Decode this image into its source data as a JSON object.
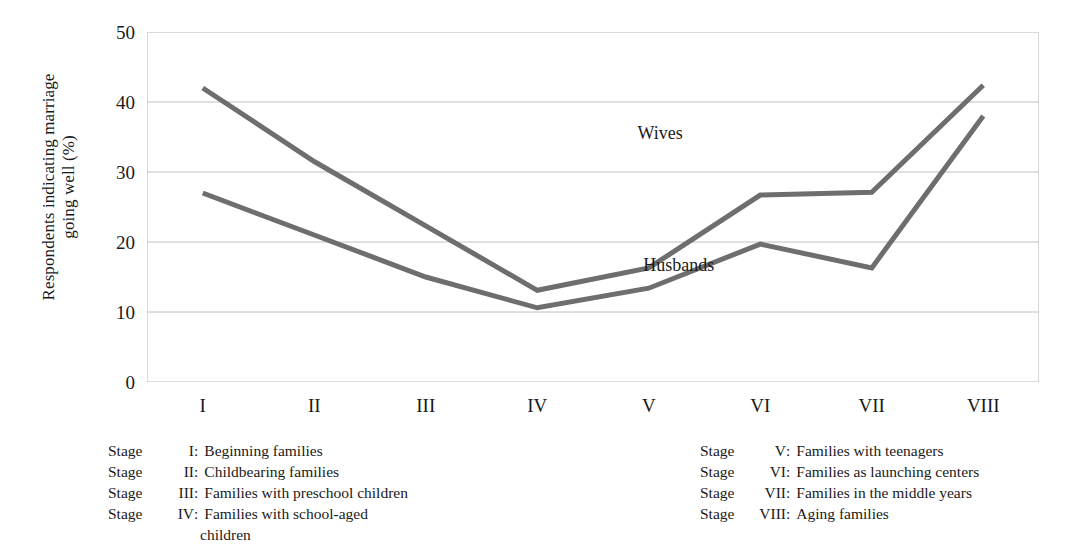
{
  "chart_data": {
    "type": "line",
    "title": "",
    "xlabel": "",
    "ylabel": "Respondents indicating marriage going well (%)",
    "ylabel_line1": "Respondents indicating marriage",
    "ylabel_line2": "going well (%)",
    "categories": [
      "I",
      "II",
      "III",
      "IV",
      "V",
      "VI",
      "VII",
      "VIII"
    ],
    "ylim": [
      0,
      50
    ],
    "yticks": [
      0,
      10,
      20,
      30,
      40,
      50
    ],
    "xlim": [
      0,
      8
    ],
    "grid": true,
    "legend_position": "inline-labels",
    "line_color": "#6e6e6e",
    "grid_color": "#b9b9b9",
    "series": [
      {
        "name": "Wives",
        "label_x": 4.4,
        "label_y": 35.5,
        "values": [
          42.0,
          31.5,
          22.3,
          13.1,
          16.3,
          26.7,
          27.1,
          42.4
        ]
      },
      {
        "name": "Husbands",
        "label_x": 4.45,
        "label_y": 16.6,
        "values": [
          27.0,
          21.0,
          15.0,
          10.6,
          13.4,
          19.7,
          16.3,
          38.0
        ]
      }
    ]
  },
  "axis": {
    "ytick_labels": [
      "50",
      "40",
      "30",
      "20",
      "10",
      "0"
    ],
    "xtick_labels": [
      "I",
      "II",
      "III",
      "IV",
      "V",
      "VI",
      "VII",
      "VIII"
    ]
  },
  "legend": {
    "left_column": [
      {
        "stage": "Stage",
        "numeral": "I",
        "colon": ":",
        "text": "Beginning families"
      },
      {
        "stage": "Stage",
        "numeral": "II",
        "colon": ":",
        "text": "Childbearing families"
      },
      {
        "stage": "Stage",
        "numeral": "III",
        "colon": ":",
        "text": "Families with preschool children"
      },
      {
        "stage": "Stage",
        "numeral": "IV",
        "colon": ":",
        "text": "Families with school-aged"
      }
    ],
    "left_continuation": "children",
    "right_column": [
      {
        "stage": "Stage",
        "numeral": "V",
        "colon": ":",
        "text": "Families with teenagers"
      },
      {
        "stage": "Stage",
        "numeral": "VI",
        "colon": ":",
        "text": "Families as launching centers"
      },
      {
        "stage": "Stage",
        "numeral": "VII",
        "colon": ":",
        "text": "Families in the middle years"
      },
      {
        "stage": "Stage",
        "numeral": "VIII",
        "colon": ":",
        "text": "Aging families"
      }
    ]
  }
}
